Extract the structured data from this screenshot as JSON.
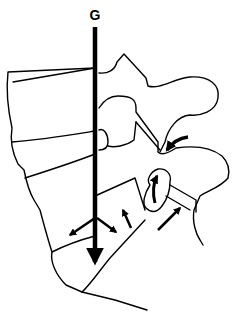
{
  "diagram": {
    "title_label": "G",
    "colors": {
      "line": "#000000",
      "background": "#ffffff"
    },
    "elements": [
      {
        "id": "gravity-line",
        "label": "G",
        "type": "vertical-arrow"
      },
      {
        "id": "vertebral-bodies",
        "type": "outline"
      },
      {
        "id": "posterior-elements",
        "type": "outline"
      },
      {
        "id": "facet-arrow-upper",
        "type": "curved-arrow"
      },
      {
        "id": "facet-arrow-lower",
        "type": "curved-arrow"
      },
      {
        "id": "disc-shear-arrows",
        "type": "arrows"
      }
    ]
  }
}
